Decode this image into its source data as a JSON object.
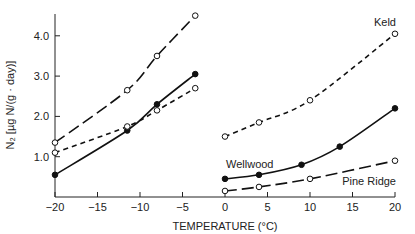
{
  "chart_data": {
    "type": "line",
    "title": "",
    "xlabel": "TEMPERATURE (°C)",
    "ylabel": "N₂ [µg N/(g · day)]",
    "xlim": [
      -20,
      20
    ],
    "ylim": [
      0,
      4.6
    ],
    "xticks": [
      "−20",
      "−15",
      "−10",
      "−5",
      "0",
      "5",
      "10",
      "15",
      "20"
    ],
    "yticks": [
      "1.0",
      "2.0",
      "3.0",
      "4.0"
    ],
    "grid": false,
    "series": [
      {
        "name": "Pine Ridge (frozen)",
        "style": "long-dash",
        "marker": "open",
        "x": [
          -20,
          -11.5,
          -8,
          -3.5
        ],
        "y": [
          1.35,
          2.65,
          3.5,
          4.5
        ]
      },
      {
        "name": "Wellwood (frozen)",
        "style": "solid",
        "marker": "filled",
        "x": [
          -20,
          -11.5,
          -8,
          -3.5
        ],
        "y": [
          0.55,
          1.65,
          2.3,
          3.05
        ]
      },
      {
        "name": "Keld (frozen)",
        "style": "short-dash",
        "marker": "open",
        "x": [
          -20,
          -11.5,
          -8,
          -3.5
        ],
        "y": [
          1.1,
          1.75,
          2.15,
          2.7
        ]
      },
      {
        "name": "Keld",
        "style": "short-dash",
        "marker": "open",
        "x": [
          0,
          4,
          10,
          20
        ],
        "y": [
          1.5,
          1.85,
          2.4,
          4.05
        ]
      },
      {
        "name": "Wellwood",
        "style": "solid",
        "marker": "filled",
        "x": [
          0,
          4,
          9,
          13.5,
          20
        ],
        "y": [
          0.45,
          0.55,
          0.8,
          1.25,
          2.2
        ]
      },
      {
        "name": "Pine Ridge",
        "style": "long-dash",
        "marker": "open",
        "x": [
          0,
          4,
          10,
          20
        ],
        "y": [
          0.15,
          0.25,
          0.45,
          0.9
        ]
      }
    ],
    "annotations": [
      "Keld",
      "Wellwood",
      "Pine Ridge"
    ]
  }
}
